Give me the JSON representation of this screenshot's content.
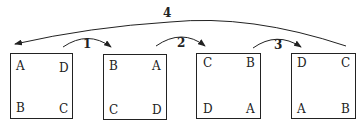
{
  "diagram": {
    "squares": [
      {
        "id": "s1",
        "corners": {
          "tl": "A",
          "tr": "D",
          "bl": "B",
          "br": "C"
        }
      },
      {
        "id": "s2",
        "corners": {
          "tl": "B",
          "tr": "A",
          "bl": "C",
          "br": "D"
        }
      },
      {
        "id": "s3",
        "corners": {
          "tl": "C",
          "tr": "B",
          "bl": "D",
          "br": "A"
        }
      },
      {
        "id": "s4",
        "corners": {
          "tl": "D",
          "tr": "C",
          "bl": "A",
          "br": "B"
        }
      }
    ],
    "arrows": [
      {
        "label": "1",
        "from": "s1",
        "to": "s2"
      },
      {
        "label": "2",
        "from": "s2",
        "to": "s3"
      },
      {
        "label": "3",
        "from": "s3",
        "to": "s4"
      },
      {
        "label": "4",
        "from": "s4",
        "to": "s1"
      }
    ],
    "colors": {
      "stroke": "#222222",
      "background": "#ffffff"
    }
  }
}
